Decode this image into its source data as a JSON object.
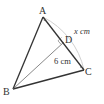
{
  "diagram": {
    "type": "geometry-triangle",
    "points": {
      "A": {
        "label": "A",
        "x": 43,
        "y": 17
      },
      "B": {
        "label": "B",
        "x": 13,
        "y": 89
      },
      "C": {
        "label": "C",
        "x": 84,
        "y": 70
      },
      "D": {
        "label": "D",
        "x": 65,
        "y": 41
      }
    },
    "segments": [
      {
        "from": "A",
        "to": "B",
        "style": "thick"
      },
      {
        "from": "A",
        "to": "C",
        "style": "thick"
      },
      {
        "from": "B",
        "to": "C",
        "style": "thick"
      },
      {
        "from": "B",
        "to": "D",
        "style": "thin"
      }
    ],
    "right_angle_at": "D",
    "arc": {
      "from": "A",
      "to": "C",
      "center": "B",
      "color": "#bbbbbb"
    },
    "labels": {
      "arc_length": "x cm",
      "dc_length": "6 cm"
    },
    "colors": {
      "line": "#333333",
      "arc": "#bbbbbb",
      "text": "#333333"
    }
  }
}
